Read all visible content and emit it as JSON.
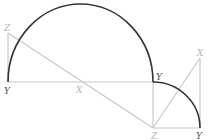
{
  "diagram": {
    "colors": {
      "arc": "#333333",
      "construction": "#c8c8c8",
      "label_dark": "#555555",
      "label_light": "#b5b5b5",
      "background": "#ffffff"
    },
    "labels": {
      "z_top_left": "Z",
      "y_bottom_left": "Y",
      "x_middle": "X",
      "y_right_of_semicircle": "Y",
      "z_bottom": "Z",
      "y_bottom_right": "Y",
      "x_top_right": "X"
    }
  }
}
